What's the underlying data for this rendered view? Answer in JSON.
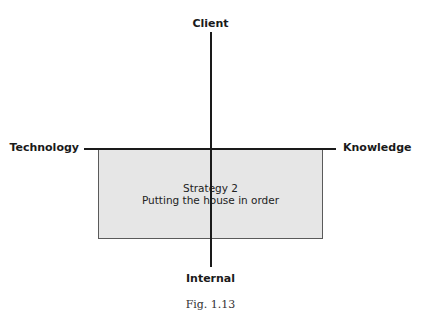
{
  "diagram": {
    "axes": {
      "top": "Client",
      "bottom": "Internal",
      "left": "Technology",
      "right": "Knowledge"
    },
    "quadrant_box": {
      "title": "Strategy 2",
      "subtitle": "Putting the house in order",
      "fill_color": "#e6e6e6"
    },
    "caption": "Fig. 1.13"
  }
}
